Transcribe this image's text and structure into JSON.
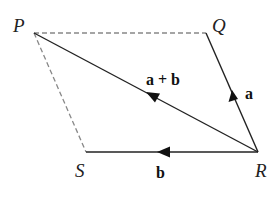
{
  "diagram": {
    "title": "",
    "vertices": [
      {
        "id": "P",
        "label": "P",
        "x": 34,
        "y": 33
      },
      {
        "id": "Q",
        "label": "Q",
        "x": 206,
        "y": 33
      },
      {
        "id": "R",
        "label": "R",
        "x": 258,
        "y": 152
      },
      {
        "id": "S",
        "label": "S",
        "x": 86,
        "y": 152
      }
    ],
    "edges": [
      {
        "from": "P",
        "to": "Q",
        "style": "dashed",
        "label": ""
      },
      {
        "from": "P",
        "to": "S",
        "style": "dashed",
        "label": ""
      },
      {
        "from": "R",
        "to": "Q",
        "style": "solid",
        "arrow": "mid",
        "label": "a"
      },
      {
        "from": "R",
        "to": "S",
        "style": "solid",
        "arrow": "mid",
        "label": "b"
      },
      {
        "from": "R",
        "to": "P",
        "style": "solid",
        "arrow": "mid",
        "label": "a + b"
      }
    ],
    "labels": {
      "P": "P",
      "Q": "Q",
      "R": "R",
      "S": "S",
      "a": "a",
      "b": "b",
      "ab": "a + b"
    },
    "colors": {
      "line": "#222222",
      "dashed": "#888888"
    }
  }
}
